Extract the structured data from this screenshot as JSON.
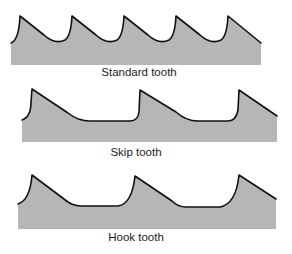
{
  "diagram": {
    "colors": {
      "blade_fill": "#b6b6b6",
      "edge_stroke": "#111111",
      "background": "#ffffff"
    },
    "panels": [
      {
        "id": "standard",
        "label": "Standard tooth",
        "tooth_count": 5
      },
      {
        "id": "skip",
        "label": "Skip tooth",
        "tooth_count": 3
      },
      {
        "id": "hook",
        "label": "Hook tooth",
        "tooth_count": 3
      }
    ]
  }
}
